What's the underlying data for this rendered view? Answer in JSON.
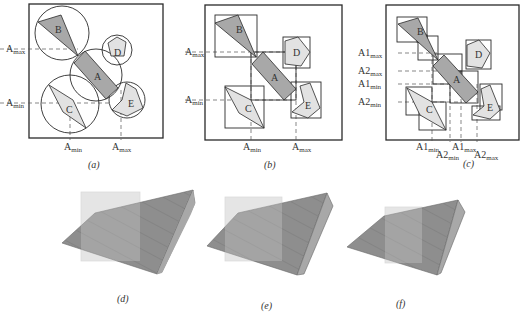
{
  "panels": {
    "a": {
      "caption": "(a)",
      "volume_type": "bounding spheres",
      "objects": [
        "A",
        "B",
        "C",
        "D",
        "E"
      ],
      "axis_labels": {
        "y_max": "A",
        "y_max_sub": "max",
        "y_min": "A",
        "y_min_sub": "min",
        "x_min": "A",
        "x_min_sub": "min",
        "x_max": "A",
        "x_max_sub": "max"
      }
    },
    "b": {
      "caption": "(b)",
      "volume_type": "axis-aligned bounding boxes",
      "objects": [
        "A",
        "B",
        "C",
        "D",
        "E"
      ],
      "axis_labels": {
        "y_max": "A",
        "y_max_sub": "max",
        "y_min": "A",
        "y_min_sub": "min",
        "x_min": "A",
        "x_min_sub": "min",
        "x_max": "A",
        "x_max_sub": "max"
      }
    },
    "c": {
      "caption": "(c)",
      "volume_type": "hierarchical bounding boxes",
      "objects": [
        "A",
        "B",
        "C",
        "D",
        "E"
      ],
      "axis_labels": {
        "y1": "A1",
        "y1_sub": "max",
        "y2": "A2",
        "y2_sub": "max",
        "y3": "A1",
        "y3_sub": "min",
        "y4": "A2",
        "y4_sub": "min",
        "x1": "A1",
        "x1_sub": "min",
        "x2": "A2",
        "x2_sub": "min",
        "x3": "A1",
        "x3_sub": "max",
        "x4": "A2",
        "x4_sub": "max"
      }
    },
    "d": {
      "caption": "(d)"
    },
    "e": {
      "caption": "(e)"
    },
    "f": {
      "caption": "(f)"
    }
  },
  "colors": {
    "dark_fill": "#a8a8a8",
    "light_fill": "#e2e2e2",
    "stroke": "#2a2a2a",
    "solid_top": "#8f8f8f",
    "solid_side": "#a5a5a5",
    "overlay_box": "#d9d9d9"
  }
}
